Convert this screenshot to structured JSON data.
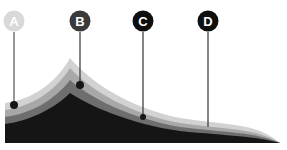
{
  "caption": "",
  "colors": {
    "band1": "#d2d2d2",
    "band2": "#a8a8a8",
    "band3": "#6e6e6e",
    "band4": "#151515",
    "marker_a": "#d9d9d9",
    "marker_b": "#3a3a3a",
    "marker_c": "#0f0f0f",
    "marker_d": "#0f0f0f",
    "pin": "#444444"
  },
  "markers": [
    {
      "label": "A",
      "x": 14,
      "y": 22,
      "pin_x": 14,
      "pin_y": 105
    },
    {
      "label": "B",
      "x": 80,
      "y": 22,
      "pin_x": 80,
      "pin_y": 85
    },
    {
      "label": "C",
      "x": 143,
      "y": 22,
      "pin_x": 143,
      "pin_y": 117
    },
    {
      "label": "D",
      "x": 208,
      "y": 22,
      "pin_x": 208,
      "pin_y": 126
    }
  ]
}
